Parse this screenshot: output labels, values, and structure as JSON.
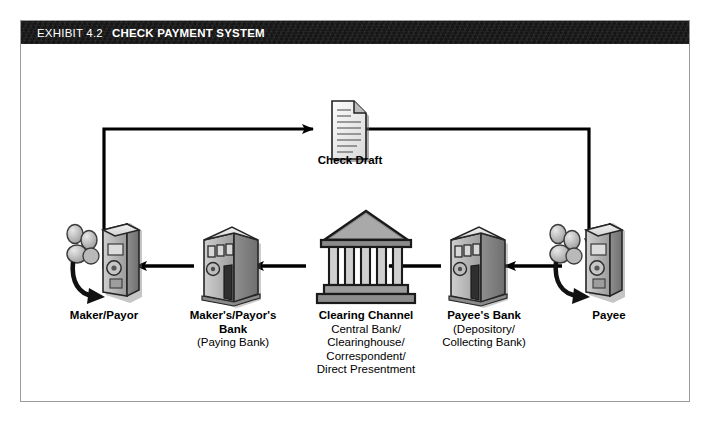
{
  "exhibit": {
    "number": "EXHIBIT 4.2",
    "title": "CHECK PAYMENT SYSTEM"
  },
  "colors": {
    "header_bg": "#151515",
    "header_text": "#ffffff",
    "frame_border": "#9a9a9a",
    "arrow": "#000000",
    "icon_light": "#e2e2e2",
    "icon_mid": "#b5b5b5",
    "icon_dark": "#7d7d7d",
    "page_bg": "#ffffff"
  },
  "diagram": {
    "check_draft": {
      "label": "Check Draft",
      "icon": "document-icon"
    },
    "nodes": [
      {
        "id": "maker",
        "icon": "person-at-terminal-icon",
        "title": "Maker/Payor",
        "sublines": []
      },
      {
        "id": "makers-bank",
        "icon": "bank-building-icon",
        "title": "Maker's/Payor's\nBank",
        "title_lines": [
          "Maker's/Payor's",
          "Bank"
        ],
        "sublines": [
          "(Paying Bank)"
        ]
      },
      {
        "id": "clearing-channel",
        "icon": "classical-bank-icon",
        "title": "Clearing Channel",
        "title_lines": [
          "Clearing Channel"
        ],
        "sublines": [
          "Central Bank/",
          "Clearinghouse/",
          "Correspondent/",
          "Direct Presentment"
        ]
      },
      {
        "id": "payees-bank",
        "icon": "bank-building-icon",
        "title": "Payee's Bank",
        "title_lines": [
          "Payee's Bank"
        ],
        "sublines": [
          "(Depository/",
          "Collecting Bank)"
        ]
      },
      {
        "id": "payee",
        "icon": "person-at-terminal-icon",
        "title": "Payee",
        "title_lines": [
          "Payee"
        ],
        "sublines": []
      }
    ],
    "flows": [
      {
        "id": "maker-to-check",
        "from": "maker",
        "to": "check-draft",
        "direction": "up-right"
      },
      {
        "id": "check-to-payee",
        "from": "check-draft",
        "to": "payee",
        "direction": "right-down"
      },
      {
        "id": "payee-to-payees-bank",
        "from": "payee",
        "to": "payees-bank",
        "direction": "left"
      },
      {
        "id": "payees-bank-to-clearing",
        "from": "payees-bank",
        "to": "clearing-channel",
        "direction": "left"
      },
      {
        "id": "clearing-to-makers-bank",
        "from": "clearing-channel",
        "to": "makers-bank",
        "direction": "left"
      },
      {
        "id": "makers-bank-to-maker",
        "from": "makers-bank",
        "to": "maker",
        "direction": "left"
      }
    ]
  }
}
